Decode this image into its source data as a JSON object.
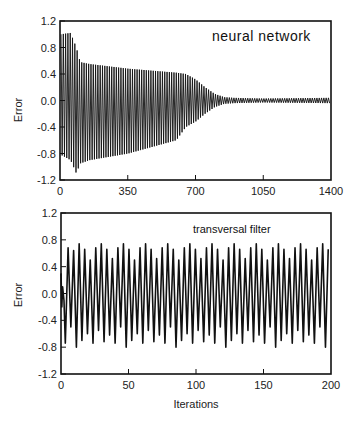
{
  "chart_data": [
    {
      "type": "line",
      "title": "neural network",
      "xlabel": "",
      "ylabel": "Error",
      "xlim": [
        0,
        1400
      ],
      "ylim": [
        -1.2,
        1.2
      ],
      "xticks": [
        "0",
        "350",
        "700",
        "1050",
        "1400"
      ],
      "yticks": [
        "1.2",
        "0.8",
        "0.4",
        "0.0",
        "-0.4",
        "-0.8",
        "-1.2"
      ],
      "grid": false,
      "description": "Oscillating error signal whose amplitude envelope starts near ±1.0, decays to about ±0.5 by iteration ~100, to ~±0.4 by ~650, then collapses rapidly between ~650 and ~850 to a small residual oscillation of about ±0.03 through iteration 1400.",
      "envelope": {
        "x": [
          0,
          50,
          80,
          100,
          150,
          350,
          600,
          650,
          700,
          750,
          800,
          850,
          900,
          1050,
          1400
        ],
        "upper": [
          1.0,
          1.02,
          0.8,
          0.58,
          0.55,
          0.48,
          0.42,
          0.4,
          0.32,
          0.2,
          0.1,
          0.05,
          0.04,
          0.03,
          0.04
        ],
        "lower": [
          -0.82,
          -0.9,
          -1.1,
          -0.95,
          -0.9,
          -0.8,
          -0.6,
          -0.4,
          -0.32,
          -0.2,
          -0.1,
          -0.05,
          -0.04,
          -0.03,
          -0.04
        ]
      },
      "oscillation_period_iterations": 12
    },
    {
      "type": "line",
      "title": "transversal filter",
      "xlabel": "Iterations",
      "ylabel": "Error",
      "xlim": [
        0,
        200
      ],
      "ylim": [
        -1.2,
        1.2
      ],
      "xticks": [
        "0",
        "50",
        "100",
        "150",
        "200"
      ],
      "yticks": [
        "1.2",
        "0.8",
        "0.4",
        "0.0",
        "-0.4",
        "-0.8",
        "-1.2"
      ],
      "grid": false,
      "description": "Sustained oscillation with no decay; peaks between about 0.5 and 0.75, troughs between about -0.55 and -0.8, period ~4 iterations.",
      "peaks": [
        0.68,
        0.64,
        0.74,
        0.66,
        0.5,
        0.68,
        0.74,
        0.66,
        0.52,
        0.68,
        0.74,
        0.66,
        0.5,
        0.68,
        0.74,
        0.66,
        0.52,
        0.68,
        0.74,
        0.66,
        0.5,
        0.68,
        0.74,
        0.66,
        0.52,
        0.68,
        0.74,
        0.66,
        0.5,
        0.68,
        0.74,
        0.66,
        0.52,
        0.68,
        0.74,
        0.66,
        0.5,
        0.68,
        0.74,
        0.66,
        0.52,
        0.68,
        0.74,
        0.66,
        0.5,
        0.68,
        0.74,
        0.66,
        0.72
      ],
      "troughs": [
        -0.74,
        -0.5,
        -0.8,
        -0.7,
        -0.6,
        -0.74,
        -0.55,
        -0.72,
        -0.62,
        -0.74,
        -0.5,
        -0.8,
        -0.7,
        -0.6,
        -0.74,
        -0.55,
        -0.72,
        -0.62,
        -0.74,
        -0.5,
        -0.8,
        -0.7,
        -0.6,
        -0.74,
        -0.55,
        -0.72,
        -0.62,
        -0.74,
        -0.5,
        -0.8,
        -0.7,
        -0.6,
        -0.74,
        -0.55,
        -0.72,
        -0.62,
        -0.74,
        -0.5,
        -0.8,
        -0.7,
        -0.6,
        -0.74,
        -0.55,
        -0.72,
        -0.62,
        -0.74,
        -0.5,
        -0.8,
        -0.7
      ],
      "oscillation_period_iterations": 4.1
    }
  ],
  "plots": [
    {
      "title": "neural network",
      "ylabel": "Error",
      "xlabel": "",
      "xticks": [
        "0",
        "350",
        "700",
        "1050",
        "1400"
      ],
      "yticks": [
        "1.2",
        "0.8",
        "0.4",
        "0.0",
        "-0.4",
        "-0.8",
        "-1.2"
      ]
    },
    {
      "title": "transversal filter",
      "ylabel": "Error",
      "xlabel": "Iterations",
      "xticks": [
        "0",
        "50",
        "100",
        "150",
        "200"
      ],
      "yticks": [
        "1.2",
        "0.8",
        "0.4",
        "0.0",
        "-0.4",
        "-0.8",
        "-1.2"
      ]
    }
  ]
}
